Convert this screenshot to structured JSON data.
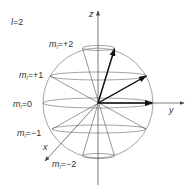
{
  "title": "l=2",
  "quantum_number_l": "2",
  "axes": {
    "z": "z",
    "y": "y",
    "x": "x"
  },
  "levels": [
    {
      "label_main": "m",
      "label_sub": "l",
      "label_value": "=+2"
    },
    {
      "label_main": "m",
      "label_sub": "l",
      "label_value": "=+1"
    },
    {
      "label_main": "m",
      "label_sub": "l",
      "label_value": "=0"
    },
    {
      "label_main": "m",
      "label_sub": "l",
      "label_value": "=−1"
    },
    {
      "label_main": "m",
      "label_sub": "l",
      "label_value": "=−2"
    }
  ],
  "colors": {
    "line": "#555555",
    "axis": "#444444",
    "arrow": "#111111",
    "text": "#333333"
  }
}
